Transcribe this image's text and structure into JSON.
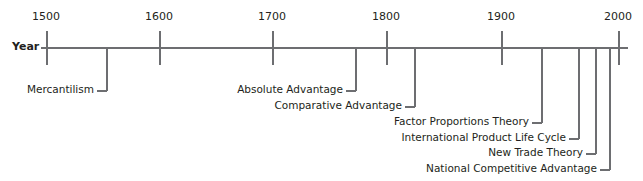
{
  "axis": {
    "label": "Year",
    "ticks": [
      {
        "label": "1500",
        "x": 46
      },
      {
        "label": "1600",
        "x": 159
      },
      {
        "label": "1700",
        "x": 272
      },
      {
        "label": "1800",
        "x": 386
      },
      {
        "label": "1900",
        "x": 501
      },
      {
        "label": "2000",
        "x": 618
      }
    ]
  },
  "events": [
    {
      "label": "Mercantilism",
      "x": 106,
      "y": 90
    },
    {
      "label": "Absolute Advantage",
      "x": 355,
      "y": 90
    },
    {
      "label": "Comparative Advantage",
      "x": 414,
      "y": 106
    },
    {
      "label": "Factor Proportions Theory",
      "x": 541,
      "y": 122
    },
    {
      "label": "International Product Life Cycle",
      "x": 578,
      "y": 138
    },
    {
      "label": "New Trade Theory",
      "x": 595,
      "y": 153
    },
    {
      "label": "National Competitive Advantage",
      "x": 609,
      "y": 169
    }
  ],
  "colors": {
    "line": "#6d6e71",
    "text": "#231f20"
  }
}
